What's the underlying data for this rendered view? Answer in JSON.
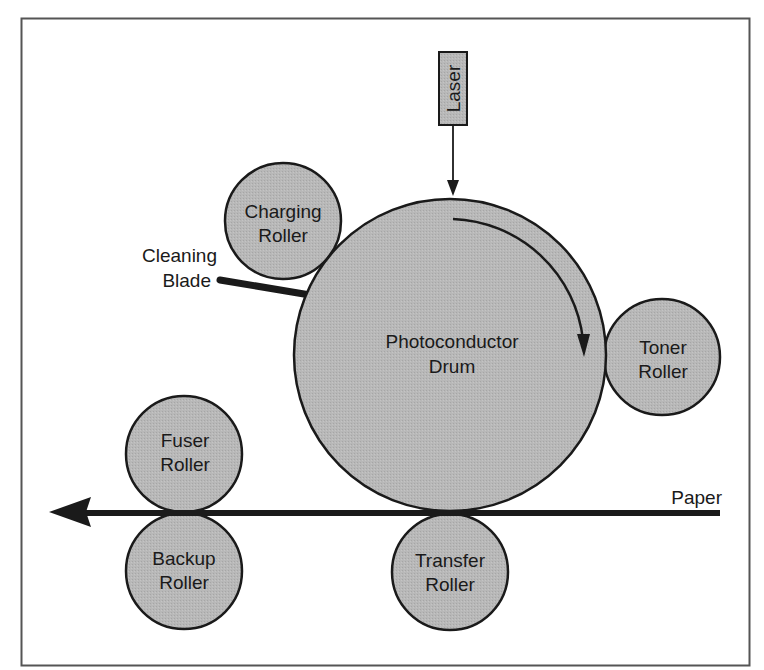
{
  "colors": {
    "background": "#ffffff",
    "frame": "#555555",
    "roller_fill": "#b5b5b5",
    "outline": "#1a1a1a",
    "laser_box_fill": "#bdbdbd"
  },
  "components": {
    "laser": {
      "label": "Laser"
    },
    "drum": {
      "line1": "Photoconductor",
      "line2": "Drum"
    },
    "charging_roller": {
      "line1": "Charging",
      "line2": "Roller"
    },
    "cleaning_blade": {
      "line1": "Cleaning",
      "line2": "Blade"
    },
    "toner_roller": {
      "line1": "Toner",
      "line2": "Roller"
    },
    "fuser_roller": {
      "line1": "Fuser",
      "line2": "Roller"
    },
    "backup_roller": {
      "line1": "Backup",
      "line2": "Roller"
    },
    "transfer_roller": {
      "line1": "Transfer",
      "line2": "Roller"
    },
    "paper": {
      "label": "Paper"
    }
  },
  "annotations": {
    "drum_rotation": "clockwise",
    "paper_direction": "right-to-left"
  }
}
